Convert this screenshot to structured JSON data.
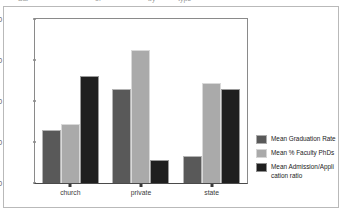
{
  "top_clipped_text": {
    "fragments": [
      "Bar",
      "of",
      "by",
      "type"
    ]
  },
  "chart_data": {
    "type": "bar",
    "title": "",
    "subtitle": "",
    "xlabel": "",
    "ylabel": "",
    "categories": [
      "church",
      "private",
      "state"
    ],
    "series": [
      {
        "name": "Mean Graduation Rate",
        "color": "#595959",
        "values": [
          63.0,
          73.0,
          56.5
        ]
      },
      {
        "name": "Mean % Faculty PhDs",
        "color": "#aaaaaa",
        "values": [
          64.3,
          82.5,
          74.5
        ]
      },
      {
        "name": "Mean Admission/Appli cation ratio",
        "color": "#1f1f1f",
        "values": [
          76.0,
          55.5,
          73.0
        ]
      }
    ],
    "ylim": [
      50,
      90
    ],
    "yticks": [
      50,
      60,
      70,
      80,
      90
    ],
    "ytick_labels": [
      "50",
      "60",
      "70",
      "80",
      "90"
    ],
    "grid": false,
    "legend_position": "right"
  },
  "legend": {
    "entries": [
      {
        "label": "Mean Graduation Rate",
        "color": "#595959"
      },
      {
        "label": "Mean % Faculty PhDs",
        "color": "#aaaaaa"
      },
      {
        "label": "Mean Admission/Appli cation ratio",
        "color": "#1f1f1f"
      }
    ]
  }
}
